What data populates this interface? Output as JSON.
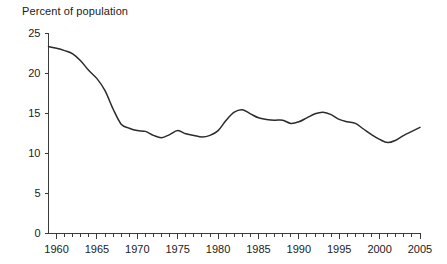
{
  "chart_data": {
    "type": "line",
    "title": "",
    "ylabel": "Percent of population",
    "xlabel": "",
    "ylim": [
      0,
      25
    ],
    "xlim": [
      1959,
      2005
    ],
    "grid": false,
    "legend": null,
    "y_ticks": [
      0,
      5,
      10,
      15,
      20,
      25
    ],
    "y_tick_labels": [
      "0",
      "5",
      "10",
      "15",
      "20",
      "25"
    ],
    "x_tick_labels": [
      "1960",
      "1965",
      "1970",
      "1975",
      "1980",
      "1985",
      "1990",
      "1995",
      "2000",
      "2005"
    ],
    "x_tick_values": [
      1960,
      1965,
      1970,
      1975,
      1980,
      1985,
      1990,
      1995,
      2000,
      2005
    ],
    "x_minor_tick_interval": 1,
    "series": [
      {
        "name": "Percent of population",
        "color": "#2b2b2b",
        "x": [
          1959,
          1960,
          1961,
          1962,
          1963,
          1964,
          1965,
          1966,
          1967,
          1968,
          1969,
          1970,
          1971,
          1972,
          1973,
          1974,
          1975,
          1976,
          1977,
          1978,
          1979,
          1980,
          1981,
          1982,
          1983,
          1984,
          1985,
          1986,
          1987,
          1988,
          1989,
          1990,
          1991,
          1992,
          1993,
          1994,
          1995,
          1996,
          1997,
          1998,
          1999,
          2000,
          2001,
          2002,
          2003,
          2004,
          2005
        ],
        "values": [
          23.3,
          23.1,
          22.8,
          22.4,
          21.5,
          20.3,
          19.3,
          17.8,
          15.5,
          13.6,
          13.1,
          12.8,
          12.7,
          12.2,
          11.9,
          12.3,
          12.8,
          12.4,
          12.2,
          12.0,
          12.2,
          12.8,
          14.1,
          15.1,
          15.4,
          14.9,
          14.4,
          14.2,
          14.1,
          14.1,
          13.7,
          13.9,
          14.4,
          14.9,
          15.1,
          14.8,
          14.2,
          13.9,
          13.7,
          13.0,
          12.3,
          11.7,
          11.3,
          11.6,
          12.2,
          12.7,
          13.2
        ]
      }
    ]
  }
}
